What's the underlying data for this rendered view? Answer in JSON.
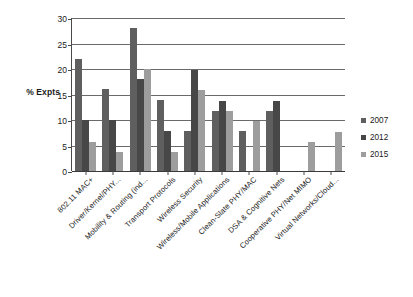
{
  "chart_data": {
    "type": "bar",
    "title": "",
    "xlabel": "",
    "ylabel": "% Expts",
    "ylim": [
      0,
      30
    ],
    "yticks": [
      0,
      5,
      10,
      15,
      20,
      25,
      30
    ],
    "ytick_labels": [
      "0",
      "5",
      "10",
      "15",
      "20",
      "25",
      "30"
    ],
    "grid": true,
    "legend_position": "right",
    "categories": [
      "802.11 MAC+",
      "Driver/Kernel/PHY...",
      "Mobility & Routing (ind...",
      "Transport Protocols",
      "Wireless Security",
      "Wireless/Mobile Applications",
      "Clean-Slate PHY/MAC",
      "DSA & Cognitive Nets",
      "Cooperative PHY/Net MIMO",
      "Virtual Networks/Cloud..."
    ],
    "series": [
      {
        "name": "2007",
        "color": "#5f5f5f",
        "values": [
          22,
          16,
          28,
          14,
          7.8,
          11.7,
          7.8,
          11.7,
          0,
          0
        ]
      },
      {
        "name": "2012",
        "color": "#474747",
        "values": [
          10,
          10,
          18,
          7.8,
          19.8,
          13.8,
          0,
          13.8,
          0,
          0
        ]
      },
      {
        "name": "2015",
        "color": "#9d9d9d",
        "values": [
          5.7,
          3.7,
          20,
          3.7,
          15.8,
          11.7,
          9.8,
          0,
          5.6,
          7.6
        ]
      }
    ]
  }
}
